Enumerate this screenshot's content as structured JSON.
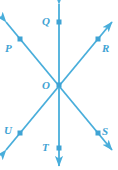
{
  "figure": {
    "width": 118,
    "height": 170,
    "background_color": "#ffffff",
    "line_color": "#49AEDB",
    "marker_color": "#3FA3D4",
    "label_color": "#3FA3D4",
    "stroke_width": 1.8,
    "marker_size": 5
  },
  "center": {
    "name": "O",
    "label": "O",
    "x": 59,
    "y": 85,
    "label_x": 42,
    "label_y": 80
  },
  "lines": [
    {
      "id": "line-QT",
      "name": "vertical-line",
      "through": [
        "Q",
        "O",
        "T"
      ],
      "x1": 59,
      "y1": 4,
      "x2": 59,
      "y2": 166,
      "double_headed": true
    },
    {
      "id": "line-PS",
      "name": "diagonal-line-descending",
      "through": [
        "P",
        "O",
        "S"
      ],
      "x1": 6,
      "y1": 22,
      "x2": 112,
      "y2": 150,
      "double_headed": true
    },
    {
      "id": "line-UR",
      "name": "diagonal-line-ascending",
      "through": [
        "U",
        "O",
        "R"
      ],
      "x1": 6,
      "y1": 150,
      "x2": 112,
      "y2": 22,
      "double_headed": true
    }
  ],
  "points": [
    {
      "name": "Q",
      "label": "Q",
      "x": 59,
      "y": 22,
      "label_x": 42,
      "label_y": 16
    },
    {
      "name": "P",
      "label": "P",
      "x": 20,
      "y": 39,
      "label_x": 5,
      "label_y": 43
    },
    {
      "name": "R",
      "label": "R",
      "x": 98,
      "y": 39,
      "label_x": 102,
      "label_y": 43
    },
    {
      "name": "U",
      "label": "U",
      "x": 20,
      "y": 133,
      "label_x": 4,
      "label_y": 125
    },
    {
      "name": "S",
      "label": "S",
      "x": 98,
      "y": 133,
      "label_x": 102,
      "label_y": 126
    },
    {
      "name": "T",
      "label": "T",
      "x": 59,
      "y": 148,
      "label_x": 42,
      "label_y": 142
    }
  ]
}
